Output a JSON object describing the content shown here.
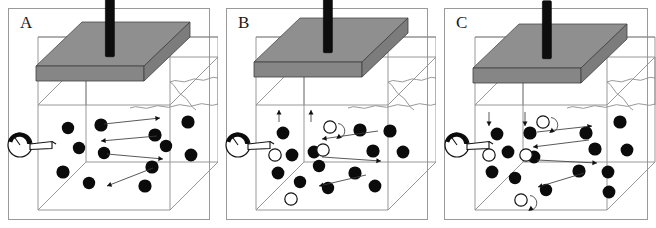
{
  "figure": {
    "width": 656,
    "height": 228,
    "background": "#ffffff",
    "panel_border_color": "#9a9a9a",
    "particle_fill": "#0b0b0b",
    "open_particle_fill": "#ffffff",
    "plate_top_color": "#8f8f8f",
    "plate_front_color": "#868686",
    "rod_color": "#0d0d0d",
    "wire_color": "#8d8d8d",
    "arrow_color": "#3b3b3b"
  },
  "panels": [
    {
      "id": "panel-a",
      "label": "A",
      "x": 0,
      "plate_state": "resting",
      "description": "Plate resting on bed; horizontal flow arrows only; all particles settled and solid (black)",
      "black_particles": [
        {
          "cx": 68,
          "cy": 128,
          "r": 6.2
        },
        {
          "cx": 101,
          "cy": 125,
          "r": 6.6
        },
        {
          "cx": 155,
          "cy": 135,
          "r": 6.6
        },
        {
          "cx": 188,
          "cy": 122,
          "r": 6.6
        },
        {
          "cx": 79,
          "cy": 148,
          "r": 6.2
        },
        {
          "cx": 104,
          "cy": 153,
          "r": 6.2
        },
        {
          "cx": 166,
          "cy": 146,
          "r": 6.2
        },
        {
          "cx": 191,
          "cy": 155,
          "r": 6.4
        },
        {
          "cx": 63,
          "cy": 172,
          "r": 6.6
        },
        {
          "cx": 89,
          "cy": 183,
          "r": 6.2
        },
        {
          "cx": 152,
          "cy": 167,
          "r": 6.6
        },
        {
          "cx": 145,
          "cy": 186,
          "r": 6.6
        }
      ],
      "open_particles": [],
      "flow_arrows": [
        {
          "x1": 104,
          "y1": 124,
          "x2": 160,
          "y2": 118,
          "dir": "right"
        },
        {
          "x1": 157,
          "y1": 136,
          "x2": 101,
          "y2": 141,
          "dir": "left"
        },
        {
          "x1": 107,
          "y1": 154,
          "x2": 163,
          "y2": 159,
          "dir": "right"
        },
        {
          "x1": 153,
          "y1": 168,
          "x2": 107,
          "y2": 186,
          "dir": "left"
        }
      ],
      "vertical_arrows": [],
      "loop_arrows": []
    },
    {
      "id": "panel-b",
      "label": "B",
      "x": 218,
      "plate_state": "lifting",
      "description": "Plate lifted; upward suction arrows under plate; mixture of black settled particles and open (white) resuspended particles; a curled loop arrow indicates rolling motion",
      "black_particles": [
        {
          "cx": 65,
          "cy": 133,
          "r": 6.4
        },
        {
          "cx": 142,
          "cy": 130,
          "r": 6.6
        },
        {
          "cx": 172,
          "cy": 131,
          "r": 6.6
        },
        {
          "cx": 74,
          "cy": 155,
          "r": 6.4
        },
        {
          "cx": 96,
          "cy": 152,
          "r": 6.4
        },
        {
          "cx": 155,
          "cy": 151,
          "r": 6.6
        },
        {
          "cx": 185,
          "cy": 152,
          "r": 6.4
        },
        {
          "cx": 60,
          "cy": 173,
          "r": 6.4
        },
        {
          "cx": 101,
          "cy": 166,
          "r": 6.2
        },
        {
          "cx": 82,
          "cy": 182,
          "r": 6.2
        },
        {
          "cx": 137,
          "cy": 173,
          "r": 6.6
        },
        {
          "cx": 157,
          "cy": 186,
          "r": 6.4
        },
        {
          "cx": 110,
          "cy": 188,
          "r": 6.2
        }
      ],
      "open_particles": [
        {
          "cx": 112,
          "cy": 127,
          "r": 6.2
        },
        {
          "cx": 105,
          "cy": 150,
          "r": 6.2
        },
        {
          "cx": 57,
          "cy": 155,
          "r": 6.2
        },
        {
          "cx": 73,
          "cy": 199,
          "r": 6.2
        }
      ],
      "flow_arrows": [
        {
          "x1": 160,
          "y1": 131,
          "x2": 104,
          "y2": 139,
          "dir": "left"
        },
        {
          "x1": 104,
          "y1": 157,
          "x2": 163,
          "y2": 161,
          "dir": "right"
        },
        {
          "x1": 148,
          "y1": 175,
          "x2": 101,
          "y2": 186,
          "dir": "left"
        }
      ],
      "vertical_arrows": [
        {
          "x": 61,
          "y1": 122,
          "y2": 110,
          "dir": "up"
        },
        {
          "x": 93,
          "y1": 122,
          "y2": 110,
          "dir": "up"
        }
      ],
      "loop_arrows": [
        {
          "cx": 120,
          "cy": 131,
          "r": 7.5
        }
      ]
    },
    {
      "id": "panel-c",
      "label": "C",
      "x": 436,
      "plate_state": "pressing",
      "description": "Plate pressing down; downward arrows under plate; black and open particles with two curled loop arrows showing rolling/entrained grains",
      "black_particles": [
        {
          "cx": 60,
          "cy": 134,
          "r": 6.4
        },
        {
          "cx": 93,
          "cy": 133,
          "r": 6.6
        },
        {
          "cx": 149,
          "cy": 133,
          "r": 6.6
        },
        {
          "cx": 183,
          "cy": 122,
          "r": 6.6
        },
        {
          "cx": 71,
          "cy": 152,
          "r": 6.4
        },
        {
          "cx": 158,
          "cy": 149,
          "r": 6.6
        },
        {
          "cx": 190,
          "cy": 150,
          "r": 6.4
        },
        {
          "cx": 97,
          "cy": 157,
          "r": 6.4
        },
        {
          "cx": 55,
          "cy": 172,
          "r": 6.4
        },
        {
          "cx": 142,
          "cy": 171,
          "r": 6.6
        },
        {
          "cx": 171,
          "cy": 172,
          "r": 6.4
        },
        {
          "cx": 78,
          "cy": 178,
          "r": 6.2
        },
        {
          "cx": 172,
          "cy": 192,
          "r": 6.4
        },
        {
          "cx": 109,
          "cy": 190,
          "r": 6.2
        }
      ],
      "open_particles": [
        {
          "cx": 106,
          "cy": 122,
          "r": 6.2
        },
        {
          "cx": 89,
          "cy": 155,
          "r": 6.2
        },
        {
          "cx": 52,
          "cy": 155,
          "r": 6.2
        },
        {
          "cx": 84,
          "cy": 200,
          "r": 6.2
        }
      ],
      "flow_arrows": [
        {
          "x1": 100,
          "y1": 132,
          "x2": 155,
          "y2": 126,
          "dir": "right"
        },
        {
          "x1": 152,
          "y1": 140,
          "x2": 96,
          "y2": 147,
          "dir": "left"
        },
        {
          "x1": 100,
          "y1": 160,
          "x2": 160,
          "y2": 163,
          "dir": "right"
        },
        {
          "x1": 147,
          "y1": 173,
          "x2": 101,
          "y2": 187,
          "dir": "left"
        }
      ],
      "vertical_arrows": [
        {
          "x": 52,
          "y1": 112,
          "y2": 126,
          "dir": "down"
        },
        {
          "x": 88,
          "y1": 112,
          "y2": 126,
          "dir": "down"
        }
      ],
      "loop_arrows": [
        {
          "cx": 114,
          "cy": 125,
          "r": 7.5
        },
        {
          "cx": 93,
          "cy": 203,
          "r": 7.5
        }
      ]
    }
  ],
  "gauge": {
    "name": "pressure-gauge",
    "dial_radius": 12,
    "needle_angle_deg": 235,
    "pipe_length": 20
  }
}
